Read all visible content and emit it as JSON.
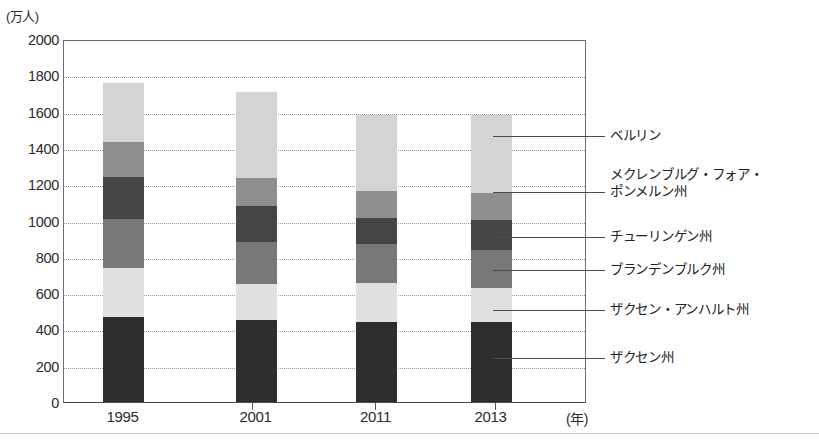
{
  "chart_data": {
    "type": "bar",
    "stacked": true,
    "title": "",
    "xlabel": "年",
    "ylabel": "(万人)",
    "ylim": [
      0,
      2000
    ],
    "ytick_step": 200,
    "grid": true,
    "legend_position": "right-callout",
    "categories": [
      "1995",
      "2001",
      "2011",
      "2013"
    ],
    "ytick_labels": [
      "2000",
      "1800",
      "1600",
      "1400",
      "1200",
      "1000",
      "800",
      "600",
      "400",
      "200",
      "0"
    ],
    "series": [
      {
        "name": "ザクセン州",
        "color": "#2e2e2e",
        "values": [
          470,
          450,
          440,
          440
        ]
      },
      {
        "name": "ザクセン・アンハルト州",
        "color": "#e0e0e0",
        "values": [
          270,
          200,
          215,
          190
        ]
      },
      {
        "name": "ブランデンブルク州",
        "color": "#787878",
        "values": [
          270,
          230,
          215,
          210
        ]
      },
      {
        "name": "チューリンゲン州",
        "color": "#454545",
        "values": [
          230,
          200,
          145,
          165
        ]
      },
      {
        "name": "メクレンブルグ・フォア・ポンメルン州",
        "color": "#8f8f8f",
        "values": [
          190,
          155,
          145,
          145
        ]
      },
      {
        "name": "ベルリン",
        "color": "#d4d4d4",
        "values": [
          330,
          475,
          420,
          430
        ]
      }
    ],
    "totals": [
      1760,
      1710,
      1580,
      1580
    ],
    "stack_tops": {
      "1995": [
        470,
        740,
        1010,
        1240,
        1430,
        1760
      ],
      "2001": [
        450,
        650,
        880,
        1080,
        1235,
        1710
      ],
      "2011": [
        440,
        655,
        870,
        1015,
        1160,
        1580
      ],
      "2013": [
        440,
        630,
        840,
        1005,
        1150,
        1580
      ]
    }
  },
  "axis": {
    "unit_label": "(万人)",
    "x_unit_label": "(年)"
  },
  "legend": {
    "items": [
      {
        "label": "ベルリン"
      },
      {
        "label": "メクレンブルグ・フォア・\nポンメルン州"
      },
      {
        "label": "チューリンゲン州"
      },
      {
        "label": "ブランデンブルク州"
      },
      {
        "label": "ザクセン・アンハルト州"
      },
      {
        "label": "ザクセン州"
      }
    ]
  }
}
